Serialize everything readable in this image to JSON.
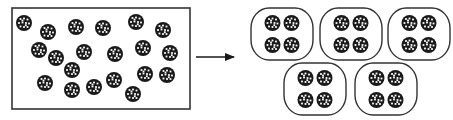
{
  "diagram": {
    "colors": {
      "stroke": "#333333",
      "particle_fill": "#1a1a1a",
      "particle_spots": "#ffffff",
      "background": "#ffffff"
    },
    "container": {
      "x": 12,
      "y": 8,
      "width": 178,
      "height": 101
    },
    "scattered_particles": [
      {
        "cx": 24,
        "cy": 23
      },
      {
        "cx": 48,
        "cy": 32
      },
      {
        "cx": 76,
        "cy": 27
      },
      {
        "cx": 103,
        "cy": 28
      },
      {
        "cx": 136,
        "cy": 22
      },
      {
        "cx": 163,
        "cy": 30
      },
      {
        "cx": 39,
        "cy": 50
      },
      {
        "cx": 56,
        "cy": 58
      },
      {
        "cx": 84,
        "cy": 52
      },
      {
        "cx": 115,
        "cy": 54
      },
      {
        "cx": 143,
        "cy": 48
      },
      {
        "cx": 170,
        "cy": 53
      },
      {
        "cx": 72,
        "cy": 70
      },
      {
        "cx": 45,
        "cy": 83
      },
      {
        "cx": 72,
        "cy": 90
      },
      {
        "cx": 94,
        "cy": 87
      },
      {
        "cx": 114,
        "cy": 80
      },
      {
        "cx": 145,
        "cy": 74
      },
      {
        "cx": 167,
        "cy": 75
      },
      {
        "cx": 133,
        "cy": 94
      }
    ],
    "arrow": {
      "x1": 196,
      "y1": 57,
      "x2": 234,
      "y2": 57
    },
    "groups": [
      {
        "x": 251,
        "y": 8,
        "width": 62,
        "height": 52
      },
      {
        "x": 320,
        "y": 8,
        "width": 62,
        "height": 52
      },
      {
        "x": 388,
        "y": 8,
        "width": 62,
        "height": 52
      },
      {
        "x": 284,
        "y": 63,
        "width": 62,
        "height": 52
      },
      {
        "x": 355,
        "y": 63,
        "width": 62,
        "height": 52
      }
    ],
    "particles_per_group": 4,
    "particle_radius": 8,
    "total_particles": 20,
    "group_count": 5
  }
}
